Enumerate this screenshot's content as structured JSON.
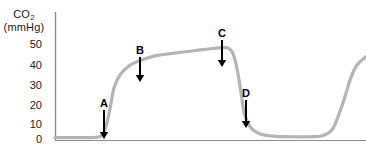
{
  "chart_data": {
    "type": "line",
    "title": "",
    "xlabel": "",
    "ylabel": "CO2 (mmHg)",
    "ylabel_text": "CO",
    "ylabel_sub": "2",
    "ylabel_units": "(mmHg)",
    "ytick_labels": [
      "50",
      "40",
      "30",
      "20",
      "10",
      "0"
    ],
    "ytick_values": [
      50,
      40,
      30,
      20,
      10,
      0
    ],
    "ylim": [
      0,
      57
    ],
    "xlim": [
      0,
      100
    ],
    "grid": false,
    "legend": false,
    "series": [
      {
        "name": "capnogram",
        "color": "#b4b4b4",
        "x": [
          0,
          5,
          10,
          13,
          15,
          16,
          17,
          18,
          19,
          21,
          24,
          27,
          30,
          33,
          38,
          44,
          50,
          54,
          55,
          56,
          57,
          58,
          59,
          60,
          61,
          63,
          66,
          70,
          76,
          82,
          86,
          89,
          91,
          93,
          95,
          97,
          100
        ],
        "values": [
          0.6,
          0.6,
          0.6,
          0.7,
          1.5,
          4,
          9,
          16,
          23,
          29,
          33,
          35,
          36.5,
          37.5,
          38.5,
          39.5,
          40.5,
          41,
          41,
          40.5,
          39,
          35,
          28,
          19,
          11,
          5,
          2.2,
          1.3,
          1.0,
          1.0,
          1.5,
          4,
          10,
          18,
          27,
          33,
          37
        ]
      }
    ],
    "annotations": [
      {
        "label": "A",
        "x_px": 104,
        "label_y_px": 98,
        "arrow_top_px": 110,
        "arrow_tip_px": 139,
        "description": "baseline / beginning of exhalation"
      },
      {
        "label": "B",
        "x_px": 140,
        "label_y_px": 45,
        "arrow_top_px": 57,
        "arrow_tip_px": 82,
        "description": "expiratory upstroke"
      },
      {
        "label": "C",
        "x_px": 222,
        "label_y_px": 28,
        "arrow_top_px": 40,
        "arrow_tip_px": 67,
        "description": "end-tidal CO2 / end of alveolar plateau"
      },
      {
        "label": "D",
        "x_px": 246,
        "label_y_px": 88,
        "arrow_top_px": 100,
        "arrow_tip_px": 128,
        "description": "inspiratory downstroke"
      }
    ]
  },
  "axes": {
    "axis_color": "#8c8c8c",
    "origin_px": {
      "x": 55,
      "y": 139
    },
    "y_top_px": 12,
    "x_right_px": 366
  },
  "style": {
    "waveform_color": "#b4b4b4",
    "arrow_color": "#000000",
    "text_color": "#1a1a1a",
    "background": "#ffffff"
  }
}
